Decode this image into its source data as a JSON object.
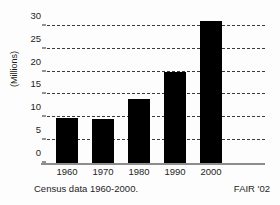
{
  "chart_data": {
    "type": "bar",
    "title": "",
    "xlabel": "",
    "ylabel": "(Millions)",
    "categories": [
      "1960",
      "1970",
      "1980",
      "1990",
      "2000"
    ],
    "values": [
      9.8,
      9.6,
      14,
      20,
      31
    ],
    "ylim": [
      0,
      33
    ],
    "yticks": [
      0,
      5,
      10,
      15,
      20,
      25,
      30
    ],
    "ytick_labels": [
      "0",
      "5",
      "10",
      "15",
      "20",
      "25",
      "30"
    ],
    "grid": true,
    "grid_style": "dashed",
    "legend": "none",
    "bar_color": "#000000",
    "background_color": "#fdfdfd",
    "axis_color": "#8d8d8d"
  },
  "captions": {
    "source": "Census data 1960-2000.",
    "credit": "FAIR '02"
  }
}
